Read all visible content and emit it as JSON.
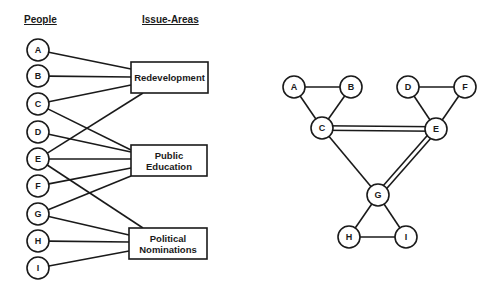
{
  "left_diagram": {
    "headers": {
      "people": "People",
      "issue_areas": "Issue-Areas"
    },
    "people": [
      {
        "id": "A",
        "label": "A",
        "cx": 38,
        "cy": 50
      },
      {
        "id": "B",
        "label": "B",
        "cx": 38,
        "cy": 76
      },
      {
        "id": "C",
        "label": "C",
        "cx": 38,
        "cy": 104
      },
      {
        "id": "D",
        "label": "D",
        "cx": 38,
        "cy": 132
      },
      {
        "id": "E",
        "label": "E",
        "cx": 38,
        "cy": 159
      },
      {
        "id": "F",
        "label": "F",
        "cx": 38,
        "cy": 186
      },
      {
        "id": "G",
        "label": "G",
        "cx": 38,
        "cy": 214
      },
      {
        "id": "H",
        "label": "H",
        "cx": 38,
        "cy": 241
      },
      {
        "id": "I",
        "label": "I",
        "cx": 38,
        "cy": 268
      }
    ],
    "issue_areas": [
      {
        "id": "redevelopment",
        "lines": [
          "Redevelopment"
        ],
        "x": 131,
        "y": 62,
        "w": 77,
        "h": 31
      },
      {
        "id": "public-education",
        "lines": [
          "Public",
          "Education"
        ],
        "x": 131,
        "y": 145,
        "w": 76,
        "h": 31
      },
      {
        "id": "political-nominations",
        "lines": [
          "Political",
          "Nominations"
        ],
        "x": 129,
        "y": 228,
        "w": 78,
        "h": 31
      }
    ],
    "edges": [
      {
        "from": "A",
        "to": "redevelopment",
        "x2": 131,
        "y2": 69
      },
      {
        "from": "B",
        "to": "redevelopment",
        "x2": 131,
        "y2": 77
      },
      {
        "from": "C",
        "to": "redevelopment",
        "x2": 131,
        "y2": 85
      },
      {
        "from": "E",
        "to": "redevelopment",
        "x2": 143,
        "y2": 93
      },
      {
        "from": "C",
        "to": "public-education",
        "x2": 131,
        "y2": 150
      },
      {
        "from": "D",
        "to": "public-education",
        "x2": 131,
        "y2": 152
      },
      {
        "from": "E",
        "to": "public-education",
        "x2": 131,
        "y2": 159
      },
      {
        "from": "F",
        "to": "public-education",
        "x2": 131,
        "y2": 168
      },
      {
        "from": "G",
        "to": "public-education",
        "x2": 131,
        "y2": 176
      },
      {
        "from": "E",
        "to": "political-nominations",
        "x2": 143,
        "y2": 228
      },
      {
        "from": "G",
        "to": "political-nominations",
        "x2": 129,
        "y2": 235
      },
      {
        "from": "H",
        "to": "political-nominations",
        "x2": 129,
        "y2": 242
      },
      {
        "from": "I",
        "to": "political-nominations",
        "x2": 129,
        "y2": 251
      }
    ]
  },
  "right_diagram": {
    "nodes": [
      {
        "id": "A",
        "label": "A",
        "cx": 294,
        "cy": 87
      },
      {
        "id": "B",
        "label": "B",
        "cx": 351,
        "cy": 87
      },
      {
        "id": "C",
        "label": "C",
        "cx": 322,
        "cy": 128
      },
      {
        "id": "D",
        "label": "D",
        "cx": 408,
        "cy": 87
      },
      {
        "id": "F",
        "label": "F",
        "cx": 465,
        "cy": 87
      },
      {
        "id": "E",
        "label": "E",
        "cx": 436,
        "cy": 129
      },
      {
        "id": "G",
        "label": "G",
        "cx": 378,
        "cy": 195
      },
      {
        "id": "H",
        "label": "H",
        "cx": 349,
        "cy": 237
      },
      {
        "id": "I",
        "label": "I",
        "cx": 406,
        "cy": 237
      }
    ],
    "edges": [
      {
        "from": "A",
        "to": "B",
        "style": "single"
      },
      {
        "from": "A",
        "to": "C",
        "style": "single"
      },
      {
        "from": "B",
        "to": "C",
        "style": "single"
      },
      {
        "from": "D",
        "to": "F",
        "style": "single"
      },
      {
        "from": "D",
        "to": "E",
        "style": "single"
      },
      {
        "from": "F",
        "to": "E",
        "style": "single"
      },
      {
        "from": "C",
        "to": "E",
        "style": "double"
      },
      {
        "from": "C",
        "to": "G",
        "style": "single"
      },
      {
        "from": "E",
        "to": "G",
        "style": "double"
      },
      {
        "from": "G",
        "to": "H",
        "style": "single"
      },
      {
        "from": "G",
        "to": "I",
        "style": "single"
      },
      {
        "from": "H",
        "to": "I",
        "style": "single"
      }
    ]
  },
  "style": {
    "stroke_color": "#1a1a1a",
    "background": "#ffffff",
    "node_radius": 11
  }
}
